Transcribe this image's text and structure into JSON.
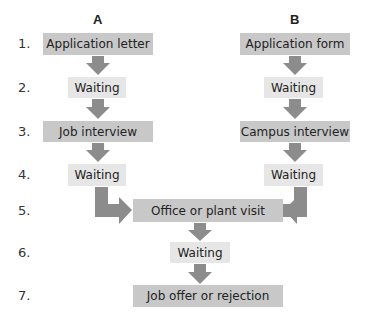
{
  "columns": {
    "a": "A",
    "b": "B"
  },
  "step_numbers": [
    "1.",
    "2.",
    "3.",
    "4.",
    "5.",
    "6.",
    "7."
  ],
  "path_a": {
    "step1": "Application letter",
    "step2": "Waiting",
    "step3": "Job interview",
    "step4": "Waiting"
  },
  "path_b": {
    "step1": "Application form",
    "step2": "Waiting",
    "step3": "Campus interview",
    "step4": "Waiting"
  },
  "shared": {
    "step5": "Office or plant visit",
    "step6": "Waiting",
    "step7": "Job offer or rejection"
  },
  "colors": {
    "primary_box": "#c8c8c8",
    "waiting_box": "#e6e6e6",
    "arrow": "#8c8c8c"
  }
}
